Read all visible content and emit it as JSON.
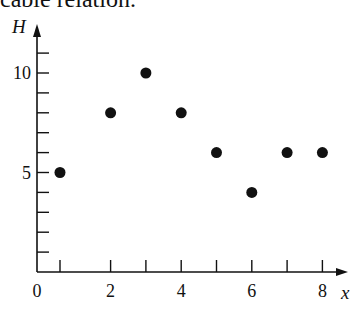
{
  "caption": "cable relation.",
  "chart_data": {
    "type": "scatter",
    "title": "",
    "xlabel": "x",
    "ylabel": "H",
    "x": [
      1,
      2,
      3,
      4,
      5,
      6,
      7,
      8
    ],
    "values": [
      5,
      8,
      10,
      8,
      6,
      4,
      6,
      6
    ],
    "xlim": [
      0,
      8.5
    ],
    "ylim": [
      0,
      11.5
    ],
    "x_tick_labels": [
      "0",
      "2",
      "4",
      "6",
      "8"
    ],
    "y_tick_labels": [
      "5",
      "10"
    ],
    "x_ticks_minor": [
      1,
      2,
      3,
      4,
      5,
      6,
      7,
      8
    ],
    "y_ticks_minor": [
      1,
      2,
      3,
      4,
      5,
      6,
      7,
      8,
      9,
      10,
      11
    ],
    "grid": false,
    "legend": null,
    "point_color": "#111111"
  }
}
